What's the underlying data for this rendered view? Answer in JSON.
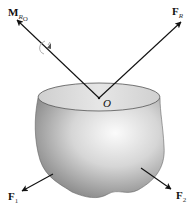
{
  "diagram": {
    "labels": {
      "moment": "M",
      "moment_sub": "R",
      "moment_sub2": "O",
      "resultant": "F",
      "resultant_sub": "R",
      "origin": "O",
      "f1": "F",
      "f1_sub": "1",
      "f2": "F",
      "f2_sub": "2"
    },
    "colors": {
      "arrow": "#111111",
      "body_light": "#f2f2f2",
      "body_dark": "#8a8a8a",
      "top_face": "#d8d8d8"
    }
  }
}
